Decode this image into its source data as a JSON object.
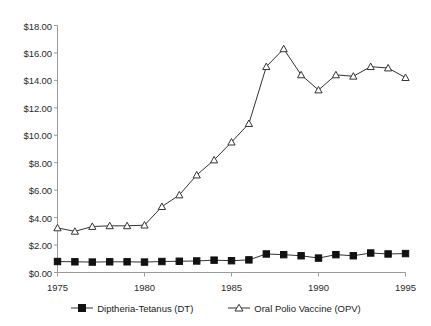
{
  "chart_data": {
    "type": "line",
    "title": "",
    "xlabel": "",
    "ylabel": "",
    "xlim": [
      1975,
      1995
    ],
    "ylim": [
      0,
      18
    ],
    "grid": false,
    "legend_position": "bottom",
    "y_tick_labels": [
      "$18.00",
      "$16.00",
      "$14.00",
      "$12.00",
      "$10.00",
      "$8.00",
      "$6.00",
      "$4.00",
      "$2.00",
      "$0.00"
    ],
    "y_ticks": [
      18,
      16,
      14,
      12,
      10,
      8,
      6,
      4,
      2,
      0
    ],
    "x_tick_labels": [
      "1975",
      "1980",
      "1985",
      "1990",
      "1995"
    ],
    "x_ticks": [
      1975,
      1980,
      1985,
      1990,
      1995
    ],
    "x": [
      1975,
      1976,
      1977,
      1978,
      1979,
      1980,
      1981,
      1982,
      1983,
      1984,
      1985,
      1986,
      1987,
      1988,
      1989,
      1990,
      1991,
      1992,
      1993,
      1994,
      1995
    ],
    "series": [
      {
        "name": "Diptheria-Tetanus (DT)",
        "marker": "filled-square",
        "values": [
          0.8,
          0.78,
          0.76,
          0.78,
          0.78,
          0.76,
          0.8,
          0.82,
          0.84,
          0.9,
          0.86,
          0.92,
          1.35,
          1.3,
          1.22,
          1.05,
          1.3,
          1.22,
          1.42,
          1.35,
          1.38
        ]
      },
      {
        "name": "Oral Polio Vaccine (OPV)",
        "marker": "open-triangle",
        "values": [
          3.25,
          3.0,
          3.35,
          3.4,
          3.4,
          3.45,
          4.8,
          5.65,
          7.1,
          8.2,
          9.5,
          10.85,
          15.0,
          16.3,
          14.4,
          13.3,
          14.4,
          14.3,
          15.0,
          14.9,
          14.2
        ]
      }
    ]
  },
  "legend": {
    "items": [
      {
        "label": "Diptheria-Tetanus (DT)"
      },
      {
        "label": "Oral Polio Vaccine (OPV)"
      }
    ]
  },
  "colors": {
    "line": "#333333",
    "axis": "#999999",
    "text": "#1a1a1a",
    "marker_fill_open": "#ffffff"
  }
}
